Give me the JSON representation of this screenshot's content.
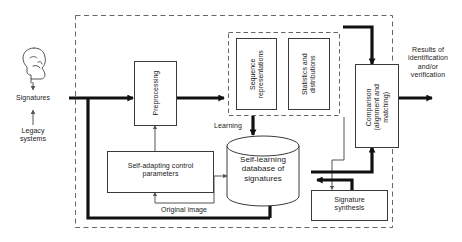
{
  "diagram": {
    "colors": {
      "stroke_thin": "#555555",
      "stroke_box": "#3a3a3a",
      "stroke_thick": "#111111",
      "dashed": "#666666",
      "background": "#ffffff",
      "text": "#1a1a1a"
    },
    "external": {
      "head_icon": "head-profile-icon",
      "signatures_label": "Signatures",
      "legacy_label": "Legacy\nsystems",
      "results_label": "Results of\nidentification\nand/or\nverification"
    },
    "boxes": {
      "preprocessing": "Preprocessing",
      "sequence_representations": "Sequence\nrepresentations",
      "statistics_distributions": "Statistics and\ndistributions",
      "comparison": "Comparison\n(alignment and\nmatching)",
      "self_adapting": "Self-adapting control\nparameters",
      "signature_synthesis": "Signature\nsynthesis",
      "database": "Self-learning\ndatabase of\nsignatures"
    },
    "edge_labels": {
      "learning": "Learning",
      "original_image": "Original image"
    }
  }
}
